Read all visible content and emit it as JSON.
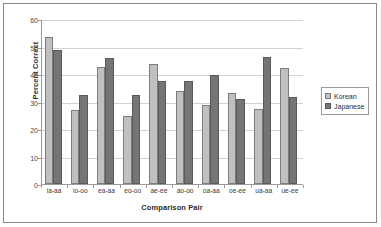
{
  "chart_data": {
    "type": "bar",
    "title": "",
    "subtitle": "",
    "xlabel": "Comparison Pair",
    "ylabel": "Percent Correct",
    "categories": [
      "ia-aa",
      "io-oo",
      "ea-aa",
      "eo-oo",
      "ae-ee",
      "ao-oo",
      "oa-aa",
      "oe-ee",
      "ua-aa",
      "ue-ee"
    ],
    "series": [
      {
        "name": "Korean",
        "color": "#c0c0c0",
        "values": [
          53.3,
          26.8,
          42.5,
          24.8,
          43.7,
          34.0,
          28.6,
          33.2,
          27.4,
          42.2
        ]
      },
      {
        "name": "Japanese",
        "color": "#757575",
        "values": [
          48.7,
          32.3,
          45.7,
          32.3,
          37.3,
          37.3,
          39.5,
          30.8,
          46.2,
          31.5
        ]
      }
    ],
    "ylim": [
      0,
      60
    ],
    "yticks": [
      0,
      10,
      20,
      30,
      40,
      50,
      60
    ],
    "ytick_labels": [
      "0",
      "10",
      "20",
      "30",
      "40",
      "50",
      "60"
    ],
    "grid": "horizontal",
    "legend_position": "right"
  },
  "legend": {
    "entries": [
      {
        "label": "Korean"
      },
      {
        "label": "Japanese"
      }
    ]
  },
  "axes": {
    "y_title": "Percent Correct",
    "x_title": "Comparison Pair"
  }
}
